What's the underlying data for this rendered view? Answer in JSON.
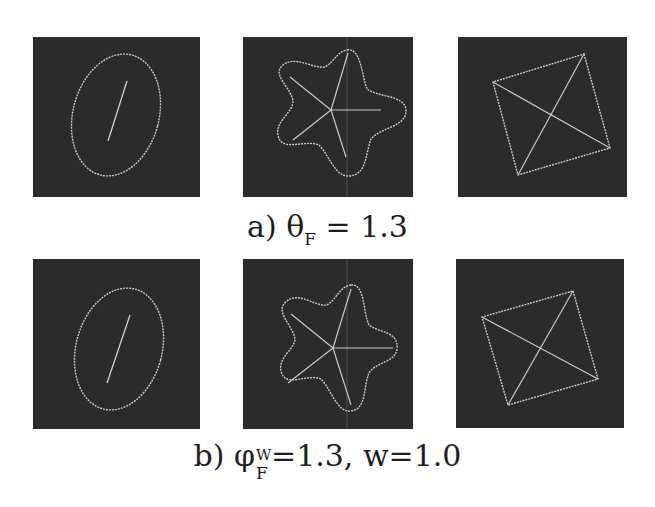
{
  "figure": {
    "row_a": {
      "caption_prefix": "a) ",
      "caption_symbol": "θ",
      "caption_subscript": "F",
      "caption_rest": " = 1.3",
      "panels": [
        {
          "name": "ellipse",
          "shape": "rotated ellipse with internal line segment"
        },
        {
          "name": "star",
          "shape": "five-lobed wavy star with spokes"
        },
        {
          "name": "square",
          "shape": "rotated square with diagonals"
        }
      ]
    },
    "row_b": {
      "caption_prefix": "b) ",
      "caption_symbol": "φ",
      "caption_superscript": "W",
      "caption_subscript": "F",
      "caption_rest": "=1.3, w=1.0",
      "panels": [
        {
          "name": "ellipse",
          "shape": "rotated ellipse with internal line segment"
        },
        {
          "name": "star",
          "shape": "five-lobed wavy star with spokes"
        },
        {
          "name": "square",
          "shape": "rotated square with diagonals"
        }
      ]
    },
    "colors": {
      "panel_background": "#2b2b2b",
      "stroke": "#c8c8c8",
      "page_background": "#ffffff"
    }
  }
}
